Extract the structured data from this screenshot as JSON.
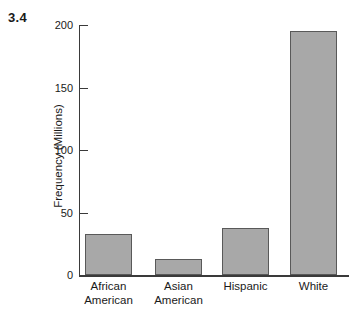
{
  "figure": {
    "number": "3.4"
  },
  "chart_data": {
    "type": "bar",
    "title": "",
    "xlabel": "",
    "ylabel": "Frequency (Millions)",
    "categories": [
      "African American",
      "Asian American",
      "Hispanic",
      "White"
    ],
    "category_lines": [
      [
        "African",
        "American"
      ],
      [
        "Asian",
        "American"
      ],
      [
        "Hispanic",
        ""
      ],
      [
        "White",
        ""
      ]
    ],
    "values": [
      33,
      13,
      38,
      195
    ],
    "ylim": [
      0,
      200
    ],
    "yticks": [
      0,
      50,
      100,
      150,
      200
    ],
    "ytick_labels": [
      "0",
      "50",
      "100",
      "150",
      "200"
    ],
    "grid": false,
    "legend": false,
    "colors": {
      "bar_fill": "#a8a8a8",
      "bar_border": "#595959",
      "axis": "#3a3a3a",
      "text": "#1a1a1a",
      "background": "#ffffff"
    }
  }
}
